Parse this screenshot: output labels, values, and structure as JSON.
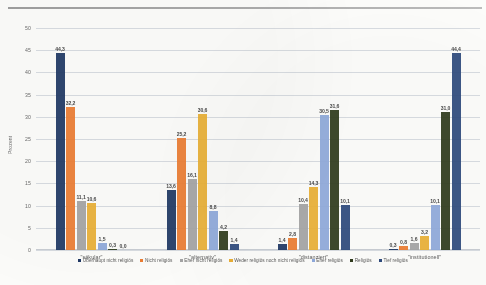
{
  "chart_data": {
    "type": "bar",
    "title": "",
    "xlabel": "",
    "ylabel": "Prozent",
    "ylim": [
      0,
      50
    ],
    "yticks": [
      "0",
      "5",
      "10",
      "15",
      "20",
      "25",
      "30",
      "35",
      "40",
      "45",
      "50"
    ],
    "grid": true,
    "legend_position": "bottom",
    "categories": [
      "\"säkular\"",
      "\"alternativ\"",
      "\"distanziert\"",
      "\"institutionell\""
    ],
    "series": [
      {
        "name": "Überhaupt nicht religiös",
        "color": "#1f3864",
        "values": [
          44.3,
          13.6,
          1.4,
          0.3
        ],
        "labels": [
          "44,3",
          "13,6",
          "1,4",
          "0,3"
        ]
      },
      {
        "name": "Nicht religiös",
        "color": "#ed7d31",
        "values": [
          32.2,
          25.2,
          2.8,
          0.8
        ],
        "labels": [
          "32,2",
          "25,2",
          "2,8",
          "0,8"
        ]
      },
      {
        "name": "Eher nicht religiös",
        "color": "#a5a5a5",
        "values": [
          11.1,
          16.1,
          10.4,
          1.6
        ],
        "labels": [
          "11,1",
          "16,1",
          "10,4",
          "1,6"
        ]
      },
      {
        "name": "Weder religiös noch nicht religiös",
        "color": "#ebb035",
        "values": [
          10.6,
          30.6,
          14.3,
          3.2
        ],
        "labels": [
          "10,6",
          "30,6",
          "14,3",
          "3,2"
        ]
      },
      {
        "name": "Eher religiös",
        "color": "#8faadc",
        "values": [
          1.5,
          8.8,
          30.5,
          10.1
        ],
        "labels": [
          "1,5",
          "8,8",
          "30,5",
          "10,1"
        ]
      },
      {
        "name": "Religiös",
        "color": "#2f3b1c",
        "values": [
          0.3,
          4.2,
          31.6,
          31.0
        ],
        "labels": [
          "0,3",
          "4,2",
          "31,6",
          "31,0"
        ]
      },
      {
        "name": "Tief religiös",
        "color": "#2e4a7d",
        "values": [
          0.0,
          1.4,
          10.1,
          44.4
        ],
        "labels": [
          "0,0",
          "1,4",
          "10,1",
          "44,4"
        ]
      }
    ]
  }
}
